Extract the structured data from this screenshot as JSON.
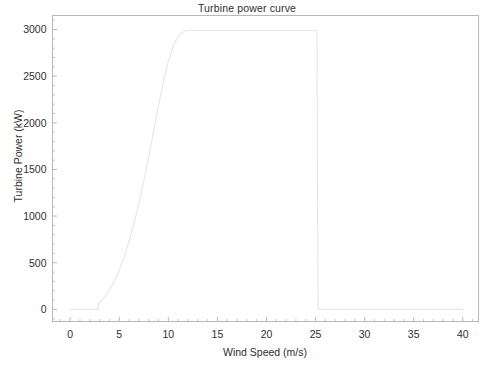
{
  "chart_data": {
    "type": "line",
    "title": "Turbine power curve",
    "xlabel": "Wind Speed (m/s)",
    "ylabel": "Turbine Power (kW)",
    "xlim": [
      -1.8,
      41.6
    ],
    "ylim": [
      -130,
      3150
    ],
    "grid": false,
    "legend": null,
    "x_ticks": [
      0,
      5,
      10,
      15,
      20,
      25,
      30,
      35,
      40
    ],
    "x_tick_labels": [
      "0",
      "5",
      "10",
      "15",
      "20",
      "25",
      "30",
      "35",
      "40"
    ],
    "x_minor_step": 1,
    "y_ticks": [
      0,
      500,
      1000,
      1500,
      2000,
      2500,
      3000
    ],
    "y_tick_labels": [
      "0",
      "500",
      "1000",
      "1500",
      "2000",
      "2500",
      "3000"
    ],
    "y_minor_step": 100,
    "line_color": "#e6e6e6",
    "frame_color": "#b8b8b8",
    "rated_power": 2990,
    "cut_in_speed": 2.9,
    "cut_out_speed": 25.2,
    "series": [
      {
        "name": "Turbine power",
        "x": [
          0,
          0.5,
          1,
          1.5,
          2,
          2.5,
          2.85,
          2.9,
          3,
          3.5,
          4,
          4.5,
          5,
          5.5,
          6,
          6.5,
          7,
          7.5,
          8,
          8.5,
          9,
          9.5,
          10,
          10.5,
          11,
          11.3,
          11.6,
          11.9,
          12.2,
          12.5,
          13,
          14,
          16,
          18,
          20,
          22,
          24,
          25,
          25.15,
          25.2,
          25.25,
          26,
          28,
          30,
          32,
          34,
          36,
          38,
          40
        ],
        "y": [
          0,
          0,
          0,
          0,
          0,
          0,
          0,
          55,
          75,
          130,
          205,
          300,
          420,
          560,
          730,
          920,
          1135,
          1375,
          1635,
          1910,
          2185,
          2440,
          2660,
          2820,
          2925,
          2960,
          2978,
          2986,
          2989,
          2990,
          2990,
          2990,
          2990,
          2990,
          2990,
          2990,
          2990,
          2990,
          2990,
          1500,
          0,
          0,
          0,
          0,
          0,
          0,
          0,
          0,
          0
        ]
      }
    ]
  }
}
